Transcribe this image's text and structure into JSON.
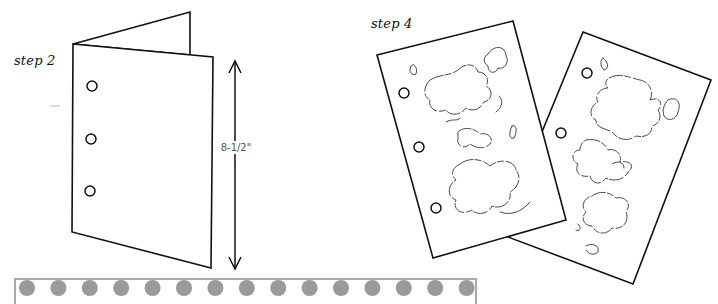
{
  "step2": {
    "label": "step 2",
    "dimension_label": "8-1/2\"",
    "hole_count": 3
  },
  "step4": {
    "label": "step 4",
    "sheet_count": 2,
    "holes_per_sheet": 3
  },
  "border_strip": {
    "dot_count": 15,
    "dot_color": "#9a9a9a",
    "border_color": "#a9a9a9"
  },
  "colors": {
    "line": "#111111",
    "background": "#ffffff",
    "dimension_text": "#555555"
  }
}
